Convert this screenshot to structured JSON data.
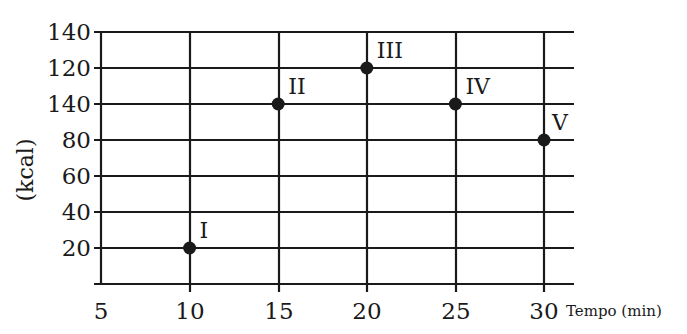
{
  "chart_data": {
    "type": "scatter",
    "title": "",
    "xlabel": "Tempo (min)",
    "ylabel": "(kcal)",
    "x_ticks": [
      5,
      10,
      15,
      20,
      25,
      30
    ],
    "x_tick_labels": [
      "5",
      "10",
      "15",
      "20",
      "25",
      "30"
    ],
    "y_tick_labels": [
      "20",
      "40",
      "60",
      "80",
      "140",
      "120",
      "140"
    ],
    "y_tick_labels_note": "tick labels as printed from bottom to top; the third-from-top label reads '140' (likely misprint for 100)",
    "xlim": [
      5,
      31.7
    ],
    "ylim": [
      0,
      140
    ],
    "grid": true,
    "legend": null,
    "points": [
      {
        "label": "I",
        "x": 10,
        "y": 20
      },
      {
        "label": "II",
        "x": 15,
        "y": 100
      },
      {
        "label": "III",
        "x": 20,
        "y": 120
      },
      {
        "label": "IV",
        "x": 25,
        "y": 100
      },
      {
        "label": "V",
        "x": 30,
        "y": 80
      }
    ],
    "x": [
      10,
      15,
      20,
      25,
      30
    ],
    "series": [
      {
        "name": "Pontos",
        "values": [
          20,
          100,
          120,
          100,
          80
        ]
      }
    ]
  },
  "layout": {
    "plot_left": 101,
    "plot_right": 574,
    "plot_top": 32,
    "plot_bottom": 284,
    "x_gridlines": [
      101,
      190,
      279,
      367,
      456,
      544
    ],
    "y_gridlines": [
      32,
      68,
      104,
      140,
      176,
      212,
      248,
      284
    ],
    "colors": {
      "ink": "#1a1a1a",
      "background": "#ffffff"
    }
  }
}
